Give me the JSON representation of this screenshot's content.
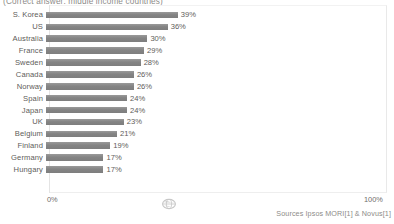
{
  "chart_data": {
    "type": "bar",
    "orientation": "horizontal",
    "title": "(Correct answer: middle income countries)",
    "xlabel": "",
    "ylabel": "",
    "xlim": [
      0,
      100
    ],
    "grid": false,
    "legend": null,
    "bar_color": "#8a8a8a",
    "categories": [
      "S. Korea",
      "US",
      "Australia",
      "France",
      "Sweden",
      "Canada",
      "Norway",
      "Spain",
      "Japan",
      "UK",
      "Belgium",
      "Finland",
      "Germany",
      "Hungary"
    ],
    "values": [
      39,
      36,
      30,
      29,
      28,
      26,
      26,
      24,
      24,
      23,
      21,
      19,
      17,
      17
    ],
    "value_labels": [
      "39%",
      "36%",
      "30%",
      "29%",
      "28%",
      "26%",
      "26%",
      "24%",
      "24%",
      "23%",
      "21%",
      "19%",
      "17%",
      "17%"
    ],
    "xticks": [
      0,
      100
    ],
    "xtick_labels": [
      "0%",
      "100%"
    ]
  },
  "axis": {
    "tick_min_label": "0%",
    "tick_max_label": "100%"
  },
  "footer": {
    "source": "Sources Ipsos MORI[1] & Novus[1]",
    "watermark_name": "gapminder-globe-logo"
  }
}
